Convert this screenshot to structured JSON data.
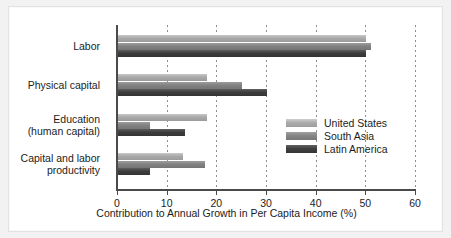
{
  "chart_data": {
    "type": "bar",
    "orientation": "horizontal",
    "title": "",
    "xlabel": "Contribution to Annual Growth in Per Capita Income (%)",
    "ylabel": "",
    "xlim": [
      0,
      60
    ],
    "xticks": [
      0,
      10,
      20,
      30,
      40,
      50,
      60
    ],
    "xtick_labels": [
      "0",
      "10",
      "20",
      "30",
      "40",
      "50",
      "60"
    ],
    "grid": "vertical-dotted",
    "legend_position": "center-right-inside",
    "categories": [
      "Labor",
      "Physical capital",
      "Education\n(human capital)",
      "Capital and labor\nproductivity"
    ],
    "category_lines": [
      [
        "Labor"
      ],
      [
        "Physical capital"
      ],
      [
        "Education",
        "(human capital)"
      ],
      [
        "Capital and labor",
        "productivity"
      ]
    ],
    "series": [
      {
        "name": "United States",
        "color": "#a9a9a9",
        "values": [
          50.0,
          18.0,
          18.0,
          13.0
        ]
      },
      {
        "name": "South Asia",
        "color": "#828282",
        "values": [
          51.0,
          25.0,
          6.5,
          17.5
        ]
      },
      {
        "name": "Latin America",
        "color": "#3d3d3d",
        "values": [
          50.0,
          30.0,
          13.5,
          6.5
        ]
      }
    ]
  },
  "legend": {
    "entries": [
      "United States",
      "South Asia",
      "Latin America"
    ]
  },
  "axis": {
    "x_title": "Contribution to Annual Growth in Per Capita Income (%)",
    "tick_labels": [
      "0",
      "10",
      "20",
      "30",
      "40",
      "50",
      "60"
    ]
  },
  "colors": {
    "series_us": "#a9a9a9",
    "series_south_asia": "#828282",
    "series_latin_america": "#3d3d3d",
    "axis": "#4a4a4a",
    "grid": "#8d8d8d",
    "text": "#1c1c1c",
    "card_background": "#ffffff",
    "page_background": "#f2f2f2"
  }
}
